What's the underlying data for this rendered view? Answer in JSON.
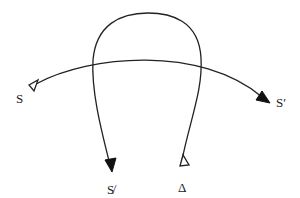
{
  "diagram": {
    "type": "braid-crossing-diagram",
    "labels": {
      "left_start": "S",
      "right_end": "S′",
      "bottom_left": "S̸",
      "bottom_right": "Δ"
    },
    "curves": [
      {
        "name": "horizontal-arc",
        "from": "S",
        "to": "S′",
        "start_marker": "open-triangle",
        "end_marker": "filled-arrow"
      },
      {
        "name": "loop-arc",
        "from": "Δ",
        "to": "S̸",
        "start_marker": "open-triangle",
        "end_marker": "filled-arrow"
      }
    ],
    "colors": {
      "stroke": "#222222",
      "background": "#ffffff"
    }
  }
}
